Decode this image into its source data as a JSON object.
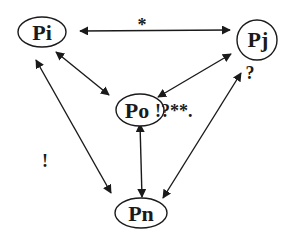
{
  "diagram": {
    "nodes": [
      {
        "id": "Pi",
        "label": "Pi",
        "shape": "ellipse"
      },
      {
        "id": "Pj",
        "label": "Pj",
        "shape": "circle"
      },
      {
        "id": "Po",
        "label": "Po",
        "shape": "ellipse"
      },
      {
        "id": "Pn",
        "label": "Pn",
        "shape": "ellipse"
      }
    ],
    "edges": [
      {
        "from": "Pi",
        "to": "Pj",
        "direction": "bidirectional",
        "label": "*"
      },
      {
        "from": "Pi",
        "to": "Po",
        "direction": "bidirectional",
        "label": ""
      },
      {
        "from": "Pj",
        "to": "Po",
        "direction": "bidirectional",
        "label": ""
      },
      {
        "from": "Po",
        "to": "Pn",
        "direction": "bidirectional",
        "label": ""
      },
      {
        "from": "Pi",
        "to": "Pn",
        "direction": "bidirectional",
        "label": "!"
      },
      {
        "from": "Pj",
        "to": "Pn",
        "direction": "bidirectional",
        "label": ""
      }
    ],
    "annotations": {
      "pj_mark": "?",
      "po_mark": "!?**."
    },
    "colors": {
      "stroke": "#1a1a1a",
      "background": "#ffffff"
    }
  }
}
